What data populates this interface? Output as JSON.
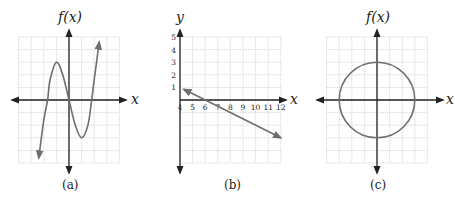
{
  "chart_data": [
    {
      "panel": "a",
      "type": "line",
      "caption": "(a)",
      "xlabel": "x",
      "ylabel": "f(x)",
      "grid": true,
      "xlim": [
        -4,
        4
      ],
      "ylim": [
        -5,
        5
      ],
      "description": "Cubic curve with local max near (-1, 3) and local min near (1, -3), arrows at both ends",
      "points": [
        [
          -2.4,
          -4.6
        ],
        [
          -2,
          -1.6
        ],
        [
          -1.7,
          0
        ],
        [
          -1.5,
          1.6
        ],
        [
          -1,
          3
        ],
        [
          -0.5,
          2
        ],
        [
          0,
          0
        ],
        [
          0.5,
          -2
        ],
        [
          1,
          -3
        ],
        [
          1.5,
          -2
        ],
        [
          1.8,
          0
        ],
        [
          2,
          1.6
        ],
        [
          2.4,
          4.6
        ]
      ]
    },
    {
      "panel": "b",
      "type": "line",
      "caption": "(b)",
      "xlabel": "x",
      "ylabel": "y",
      "grid": true,
      "x_ticks": [
        "4",
        "5",
        "6",
        "7",
        "8",
        "9",
        "10",
        "11",
        "12"
      ],
      "y_ticks": [
        "1",
        "2",
        "3",
        "4",
        "5"
      ],
      "xlim": [
        4,
        12
      ],
      "ylim": [
        -5,
        5
      ],
      "description": "Straight line with negative slope, passing through (4, 1) and (6, 0), arrows at both ends",
      "points": [
        [
          4.3,
          0.85
        ],
        [
          6,
          0
        ],
        [
          12,
          -3
        ]
      ]
    },
    {
      "panel": "c",
      "type": "line",
      "caption": "(c)",
      "xlabel": "x",
      "ylabel": "f(x)",
      "grid": true,
      "xlim": [
        -4,
        4
      ],
      "ylim": [
        -5,
        5
      ],
      "description": "Circle centered at origin with radius 3",
      "circle": {
        "cx": 0,
        "cy": 0,
        "r": 3
      }
    }
  ],
  "labels": {
    "a": {
      "ylabel": "f(x)",
      "xlabel": "x",
      "caption": "(a)"
    },
    "b": {
      "ylabel": "y",
      "xlabel": "x",
      "caption": "(b)",
      "x_ticks": [
        "4",
        "5",
        "6",
        "7",
        "8",
        "9",
        "10",
        "11",
        "12"
      ],
      "y_ticks": [
        "1",
        "2",
        "3",
        "4",
        "5"
      ]
    },
    "c": {
      "ylabel": "f(x)",
      "xlabel": "x",
      "caption": "(c)"
    }
  },
  "colors": {
    "curve": "#6e6e6e",
    "axis": "#222222",
    "grid": "#c8c8c8"
  }
}
